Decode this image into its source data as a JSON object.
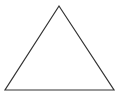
{
  "diagram": {
    "shape": "triangle",
    "background_color": "#ffffff",
    "stroke_color": "#333333",
    "fill_color": "none",
    "stroke_width": 1.2,
    "vertices": {
      "apex": [
        59,
        6
      ],
      "bottom_left": [
        5,
        90
      ],
      "bottom_right": [
        114,
        90
      ]
    },
    "points_string": "59,6 5,90 114,90"
  }
}
